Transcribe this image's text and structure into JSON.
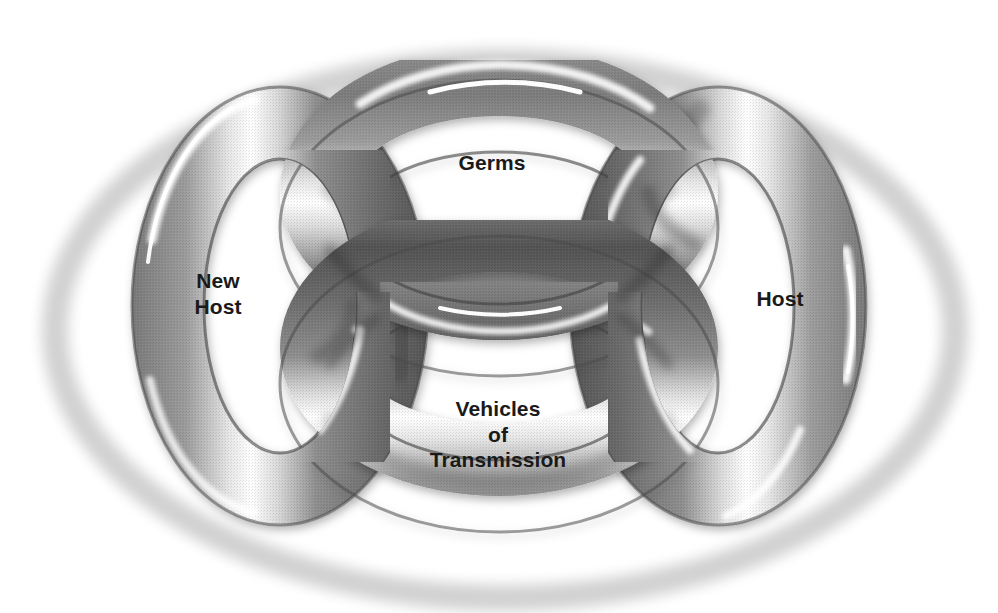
{
  "diagram": {
    "type": "interlocking-rings",
    "background_color": "#ffffff",
    "ring_color": "#757575",
    "ring_highlight_color": "#ffffff",
    "ring_shadow_color": "#3a3a3a",
    "label_color": "#1a1a1a",
    "labels": {
      "germs": "Germs",
      "new_host": "New\nHost",
      "host": "Host",
      "vehicles": "Vehicles\nof\nTransmission"
    },
    "rings": [
      {
        "name": "germs-ring",
        "label": "Germs",
        "position": "top",
        "cx": 499,
        "cy": 228,
        "rx": 219,
        "ry": 148,
        "tube": 36
      },
      {
        "name": "new-host-ring",
        "label": "New Host",
        "position": "left",
        "cx": 280,
        "cy": 306,
        "rx": 148,
        "ry": 219,
        "tube": 36
      },
      {
        "name": "host-ring",
        "label": "Host",
        "position": "right",
        "cx": 718,
        "cy": 306,
        "rx": 148,
        "ry": 219,
        "tube": 36
      },
      {
        "name": "vehicles-ring",
        "label": "Vehicles of Transmission",
        "position": "bottom",
        "cx": 499,
        "cy": 384,
        "rx": 219,
        "ry": 148,
        "tube": 36
      }
    ]
  }
}
